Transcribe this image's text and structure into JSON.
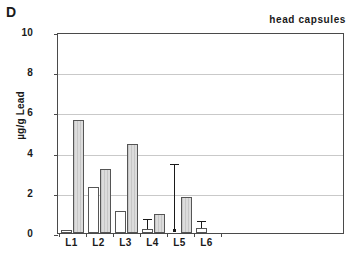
{
  "panel": {
    "label": "D"
  },
  "chart_data": {
    "type": "bar",
    "title": "head capsules",
    "xlabel": "",
    "ylabel": "µg/g Lead",
    "ylim": [
      0,
      10
    ],
    "yticks": [
      0,
      2,
      4,
      6,
      8,
      10
    ],
    "ytick_labels": [
      "0",
      "2",
      "4",
      "6",
      "8",
      "10"
    ],
    "grid": true,
    "legend": "none",
    "categories": [
      "L1",
      "L2",
      "L3",
      "L4",
      "L5",
      "L6"
    ],
    "series": [
      {
        "name": "white",
        "values": [
          0.15,
          2.3,
          1.1,
          0.2,
          0.1,
          0.25
        ],
        "errors_upper": [
          0.0,
          0.0,
          0.0,
          0.65,
          3.4,
          0.55
        ],
        "color": "#ffffff"
      },
      {
        "name": "gray",
        "values": [
          5.6,
          3.2,
          4.45,
          0.95,
          1.8,
          0.0
        ],
        "errors_upper": [
          0.0,
          0.0,
          0.0,
          0.0,
          0.0,
          0.0
        ],
        "color": "#dcdcdc"
      }
    ]
  }
}
